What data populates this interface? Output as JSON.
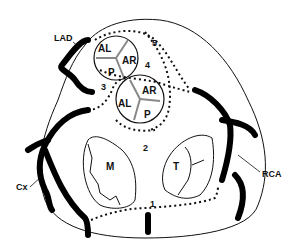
{
  "diagram": {
    "type": "anatomical",
    "colors": {
      "line": "#111111",
      "artery": "#000000",
      "leaflet": "#888888",
      "background": "#ffffff"
    },
    "vessels": {
      "lad": "LAD",
      "cx": "Cx",
      "rca": "RCA"
    },
    "valves": {
      "upper": {
        "leaflets": [
          "AL",
          "AR",
          "P"
        ]
      },
      "lower": {
        "leaflets": [
          "AL",
          "AR",
          "P"
        ]
      },
      "mitral": "M",
      "tricuspid": "T"
    },
    "numbers": [
      "1",
      "2",
      "3",
      "4",
      "5"
    ]
  }
}
